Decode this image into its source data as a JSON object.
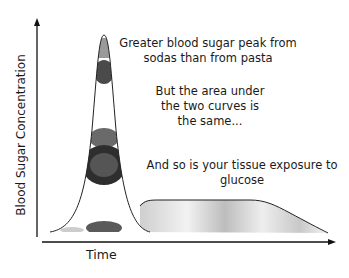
{
  "diagram": {
    "y_axis_label": "Blood Sugar Concentration",
    "x_axis_label": "Time",
    "annotations": [
      "Greater blood sugar peak from sodas than from pasta",
      "But the area under the two curves is the same...",
      "And so is your tissue exposure to glucose"
    ],
    "annotation_lines": {
      "a1": [
        "Greater blood sugar peak from",
        "sodas than from pasta"
      ],
      "a2": [
        "But the area under",
        "the two curves is",
        "the same..."
      ],
      "a3": [
        "And so is your tissue exposure to",
        "glucose"
      ]
    },
    "curves": [
      {
        "name": "sodas",
        "shape": "tall narrow peak",
        "fill": "soda cans image"
      },
      {
        "name": "pasta",
        "shape": "low wide plateau",
        "fill": "pasta image"
      }
    ],
    "colors": {
      "axis": "#111111",
      "curve_stroke": "#222222",
      "soda_fill": "#3a3a3a",
      "pasta_fill": "#d9d9d9"
    }
  }
}
